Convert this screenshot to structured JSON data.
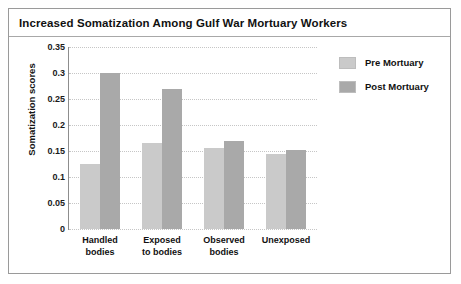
{
  "card": {
    "title": "Increased Somatization Among Gulf War Mortuary Workers"
  },
  "legend": {
    "position": "top-right",
    "entries": [
      {
        "label": "Pre Mortuary",
        "color": "#cacaca"
      },
      {
        "label": "Post Mortuary",
        "color": "#a9a9a9"
      }
    ]
  },
  "chart_data": {
    "type": "bar",
    "title": "Increased Somatization Among Gulf War Mortuary Workers",
    "xlabel": "",
    "ylabel": "Somatization scores",
    "categories": [
      "Handled bodies",
      "Exposed to bodies",
      "Observed bodies",
      "Unexposed"
    ],
    "category_lines": [
      [
        "Handled",
        "bodies"
      ],
      [
        "Exposed",
        "to bodies"
      ],
      [
        "Observed",
        "bodies"
      ],
      [
        "Unexposed",
        ""
      ]
    ],
    "series": [
      {
        "name": "Pre Mortuary",
        "color": "#cacaca",
        "values": [
          0.125,
          0.165,
          0.155,
          0.145
        ]
      },
      {
        "name": "Post Mortuary",
        "color": "#a9a9a9",
        "values": [
          0.3,
          0.27,
          0.17,
          0.152
        ]
      }
    ],
    "ylim": [
      0,
      0.35
    ],
    "ytick_step": 0.05,
    "yticks": [
      0.35,
      0.3,
      0.25,
      0.2,
      0.15,
      0.1,
      0.05,
      0
    ],
    "ytick_labels": [
      "0.35",
      "0.3",
      "0.25",
      "0.2",
      "0.15",
      "0.1",
      "0.05",
      "0"
    ],
    "grid": true,
    "grid_style": "dotted",
    "legend_position": "top-right"
  }
}
